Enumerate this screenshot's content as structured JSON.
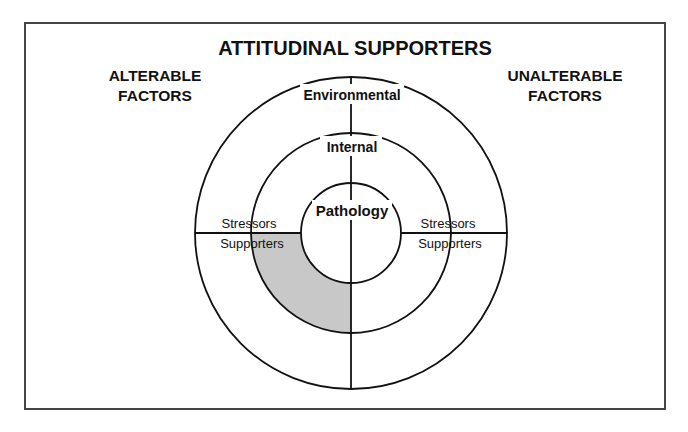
{
  "title": "ATTITUDINAL SUPPORTERS",
  "left_label": {
    "line1": "ALTERABLE",
    "line2": "FACTORS"
  },
  "right_label": {
    "line1": "UNALTERABLE",
    "line2": "FACTORS"
  },
  "rings": {
    "outer": "Environmental",
    "middle": "Internal",
    "inner": "Pathology"
  },
  "left_divider": {
    "above": "Stressors",
    "below": "Supporters"
  },
  "right_divider": {
    "above": "Stressors",
    "below": "Supporters"
  },
  "colors": {
    "shade": "#c8c8c8",
    "line": "#111111"
  }
}
